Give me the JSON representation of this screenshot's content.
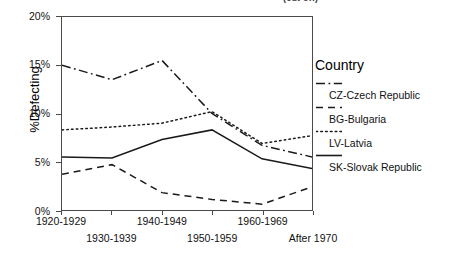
{
  "top_fragment": "(cut off)",
  "chart_data": {
    "type": "line",
    "title": "",
    "xlabel": "",
    "ylabel": "%Defecting",
    "categories": [
      "1920-1929",
      "1930-1939",
      "1940-1949",
      "1950-1959",
      "1960-1969",
      "After 1970"
    ],
    "ylim": [
      0,
      20
    ],
    "yticks": [
      0,
      5,
      10,
      15,
      20
    ],
    "ytick_labels": [
      "0%",
      "5%",
      "10%",
      "15%",
      "20%"
    ],
    "grid": false,
    "legend_position": "right",
    "legend_title": "Country",
    "series": [
      {
        "name": "CZ-Czech Republic",
        "style": "dash-dot",
        "color": "#1a1a1a",
        "values": [
          15.0,
          13.5,
          15.5,
          10.0,
          6.7,
          5.5
        ]
      },
      {
        "name": "BG-Bulgaria",
        "style": "dashed",
        "color": "#1a1a1a",
        "values": [
          3.7,
          4.7,
          1.8,
          1.1,
          0.6,
          2.4
        ]
      },
      {
        "name": "LV-Latvia",
        "style": "dotted",
        "color": "#1a1a1a",
        "values": [
          8.3,
          8.6,
          9.0,
          10.2,
          6.9,
          7.7
        ]
      },
      {
        "name": "SK-Slovak Republic",
        "style": "solid",
        "color": "#1a1a1a",
        "values": [
          5.5,
          5.4,
          7.3,
          8.3,
          5.3,
          4.3
        ]
      }
    ]
  }
}
